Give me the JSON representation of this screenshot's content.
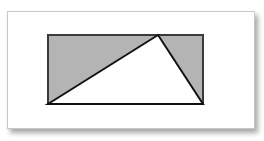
{
  "diagram": {
    "rectangle": {
      "fill": "#b4b4b4",
      "stroke": "#3a3a3a"
    },
    "triangle": {
      "fill": "#ffffff",
      "stroke": "#111111",
      "apex_position_along_top": 0.71,
      "vertices": [
        "bottom-left corner",
        "point on top edge",
        "bottom-right corner"
      ]
    },
    "shaded_regions": [
      "left shaded triangle",
      "right shaded triangle"
    ]
  }
}
